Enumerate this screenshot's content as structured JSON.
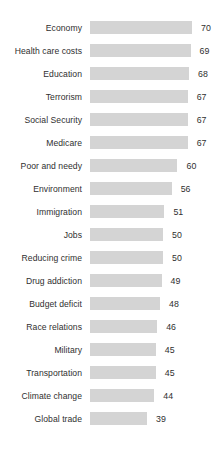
{
  "chart_data": {
    "type": "bar",
    "orientation": "horizontal",
    "title": "",
    "subtitle": "",
    "xlabel": "",
    "ylabel": "",
    "grid": false,
    "legend": false,
    "axis_visible": false,
    "value_labels_shown": true,
    "xlim": [
      0,
      70
    ],
    "categories": [
      "Economy",
      "Health care costs",
      "Education",
      "Terrorism",
      "Social Security",
      "Medicare",
      "Poor and needy",
      "Environment",
      "Immigration",
      "Jobs",
      "Reducing crime",
      "Drug addiction",
      "Budget deficit",
      "Race relations",
      "Military",
      "Transportation",
      "Climate change",
      "Global trade"
    ],
    "values": [
      70,
      69,
      68,
      67,
      67,
      67,
      60,
      56,
      51,
      50,
      50,
      49,
      48,
      46,
      45,
      45,
      44,
      39
    ],
    "colors": {
      "bar_fill": "#d4d4d4",
      "text": "#2f2f2f",
      "background": "#ffffff"
    }
  }
}
